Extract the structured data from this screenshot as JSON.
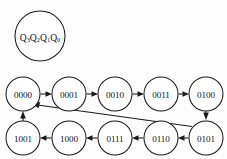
{
  "diagram": {
    "type": "state-transition-diagram",
    "title": "",
    "background_color": "#fdfdfe",
    "line_color": "#1a1a1a",
    "node_fill": "#ffffff",
    "legend": {
      "name": "state-variable-legend",
      "text": "Q3Q2Q1Q0",
      "parts": [
        {
          "base": "Q",
          "sub": "3"
        },
        {
          "base": "Q",
          "sub": "2"
        },
        {
          "base": "Q",
          "sub": "1"
        },
        {
          "base": "Q",
          "sub": "0"
        }
      ],
      "cx": 40,
      "cy": 36,
      "r": 25
    },
    "nodes": [
      {
        "id": "s0",
        "label": "0000",
        "cx": 23,
        "cy": 94,
        "r": 17,
        "row": "top"
      },
      {
        "id": "s1",
        "label": "0001",
        "cx": 69,
        "cy": 94,
        "r": 17,
        "row": "top"
      },
      {
        "id": "s2",
        "label": "0010",
        "cx": 115,
        "cy": 94,
        "r": 17,
        "row": "top"
      },
      {
        "id": "s3",
        "label": "0011",
        "cx": 161,
        "cy": 94,
        "r": 17,
        "row": "top"
      },
      {
        "id": "s4",
        "label": "0100",
        "cx": 206,
        "cy": 94,
        "r": 17,
        "row": "top"
      },
      {
        "id": "s9",
        "label": "1001",
        "cx": 23,
        "cy": 138,
        "r": 17,
        "row": "bottom"
      },
      {
        "id": "s8",
        "label": "1000",
        "cx": 69,
        "cy": 138,
        "r": 17,
        "row": "bottom"
      },
      {
        "id": "s7",
        "label": "0111",
        "cx": 115,
        "cy": 138,
        "r": 17,
        "row": "bottom"
      },
      {
        "id": "s6",
        "label": "0110",
        "cx": 161,
        "cy": 138,
        "r": 17,
        "row": "bottom"
      },
      {
        "id": "s5",
        "label": "0101",
        "cx": 206,
        "cy": 138,
        "r": 17,
        "row": "bottom"
      }
    ],
    "edges": [
      {
        "name": "edge-0000-to-0001",
        "from": "0000",
        "to": "0001",
        "kind": "horizontal-right"
      },
      {
        "name": "edge-0001-to-0010",
        "from": "0001",
        "to": "0010",
        "kind": "horizontal-right"
      },
      {
        "name": "edge-0010-to-0011",
        "from": "0010",
        "to": "0011",
        "kind": "horizontal-right"
      },
      {
        "name": "edge-0011-to-0100",
        "from": "0011",
        "to": "0100",
        "kind": "horizontal-right"
      },
      {
        "name": "edge-0100-to-0101",
        "from": "0100",
        "to": "0101",
        "kind": "vertical-down"
      },
      {
        "name": "edge-0101-to-0110",
        "from": "0101",
        "to": "0110",
        "kind": "horizontal-left"
      },
      {
        "name": "edge-0110-to-0111",
        "from": "0110",
        "to": "0111",
        "kind": "horizontal-left"
      },
      {
        "name": "edge-0111-to-1000",
        "from": "0111",
        "to": "1000",
        "kind": "horizontal-left"
      },
      {
        "name": "edge-1000-to-1001",
        "from": "1000",
        "to": "1001",
        "kind": "horizontal-left"
      },
      {
        "name": "edge-1001-to-0000",
        "from": "1001",
        "to": "0000",
        "kind": "vertical-up"
      },
      {
        "name": "edge-0101-to-0000",
        "from": "0101",
        "to": "0000",
        "kind": "diagonal-feedback"
      }
    ]
  }
}
